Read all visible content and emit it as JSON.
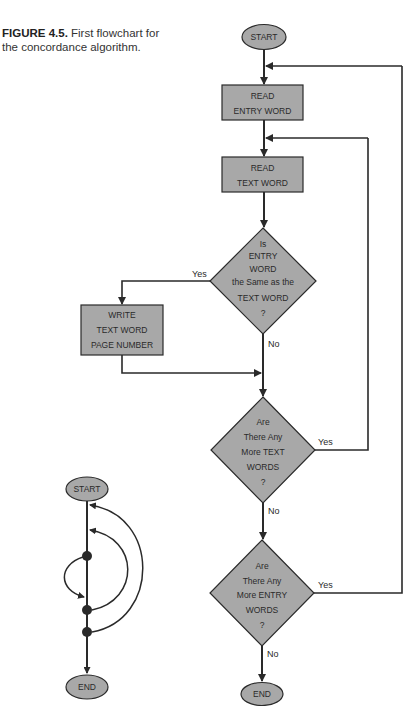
{
  "caption": {
    "figure_number": "FIGURE 4.5.",
    "text": " First flowchart for the concordance algorithm."
  },
  "colors": {
    "shape_fill": "#a8a8a8",
    "stroke": "#2a2a2a",
    "background": "#ffffff"
  },
  "flowchart": {
    "start": "START",
    "end": "END",
    "process_read_entry": [
      "READ",
      "ENTRY WORD"
    ],
    "process_read_text": [
      "READ",
      "TEXT WORD"
    ],
    "decision_same": [
      "Is",
      "ENTRY",
      "WORD",
      "the Same as the",
      "TEXT  WORD",
      "?"
    ],
    "process_write": [
      "WRITE",
      "TEXT WORD",
      "PAGE NUMBER"
    ],
    "decision_more_text": [
      "Are",
      "There Any",
      "More  TEXT",
      "WORDS",
      "?"
    ],
    "decision_more_entry": [
      "Are",
      "There Any",
      "More ENTRY",
      "WORDS",
      "?"
    ],
    "edge_labels": {
      "same_yes": "Yes",
      "same_no": "No",
      "more_text_yes": "Yes",
      "more_text_no": "No",
      "more_entry_yes": "Yes",
      "more_entry_no": "No"
    }
  },
  "mini_diagram": {
    "start": "START",
    "end": "END"
  }
}
